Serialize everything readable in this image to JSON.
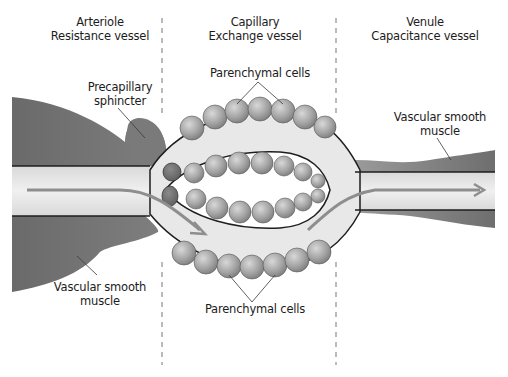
{
  "diagram": {
    "sections": [
      {
        "name": "Arteriole",
        "subtitle": "Resistance vessel"
      },
      {
        "name": "Capillary",
        "subtitle": "Exchange vessel"
      },
      {
        "name": "Venule",
        "subtitle": "Capacitance vessel"
      }
    ],
    "labels": {
      "precapillary_line1": "Precapillary",
      "precapillary_line2": "sphincter",
      "parenchymal_top": "Parenchymal cells",
      "parenchymal_bottom": "Parenchymal cells",
      "vsm_left_line1": "Vascular smooth",
      "vsm_left_line2": "muscle",
      "vsm_right_line1": "Vascular smooth",
      "vsm_right_line2": "muscle"
    },
    "colors": {
      "smooth_muscle": "#7a7a7a",
      "lumen": "#e6e6e6",
      "flow_arrow": "#8e8e8e",
      "cells": "#a8a8a8",
      "outline": "#1e1e1e",
      "divider": "#777777"
    }
  }
}
